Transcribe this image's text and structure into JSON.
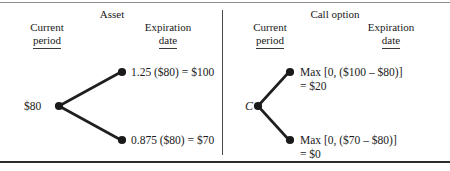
{
  "figure": {
    "panels": [
      {
        "title": "Asset",
        "columns": {
          "current": {
            "line1": "Current",
            "line2": "period"
          },
          "expiration": {
            "line1": "Expiration",
            "line2": "date"
          }
        },
        "root_label": "$80",
        "up_label": "1.25 ($80) = $100",
        "down_label": "0.875 ($80) = $70"
      },
      {
        "title": "Call option",
        "columns": {
          "current": {
            "line1": "Current",
            "line2": "period"
          },
          "expiration": {
            "line1": "Expiration",
            "line2": "date"
          }
        },
        "root_label": "C",
        "up_label_line1": "Max [0, ($100 – $80)]",
        "up_label_line2": "= $20",
        "down_label_line1": "Max [0, ($70 – $80)]",
        "down_label_line2": "= $0"
      }
    ],
    "colors": {
      "ink": "#1a1a1a",
      "branch": "#1f1f1f",
      "rule": "#2b2b2b",
      "divider": "#4a4a4a"
    }
  }
}
